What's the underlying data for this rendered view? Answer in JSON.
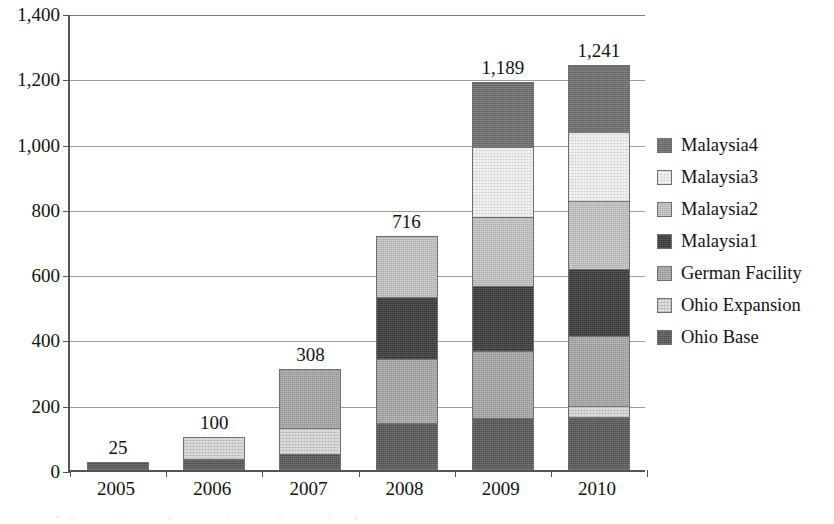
{
  "chart_data": {
    "type": "bar",
    "subtype": "stacked-bar",
    "title": "",
    "xlabel": "",
    "ylabel": "",
    "categories": [
      "2005",
      "2006",
      "2007",
      "2008",
      "2009",
      "2010"
    ],
    "ylim": [
      0,
      1400
    ],
    "ytick_values": [
      0,
      200,
      400,
      600,
      800,
      1000,
      1200,
      1400
    ],
    "ytick_labels": [
      "0",
      "200",
      "400",
      "600",
      "800",
      "1,000",
      "1,200",
      "1,400"
    ],
    "grid": true,
    "legend_position": "right",
    "stack_order_bottom_to_top": [
      "Ohio Base",
      "Ohio Expansion",
      "German Facility",
      "Malaysia1",
      "Malaysia2",
      "Malaysia3",
      "Malaysia4"
    ],
    "series": [
      {
        "name": "Ohio Base",
        "color": "#5b5b5b",
        "fill": "fill-ohio-base",
        "values": [
          25,
          35,
          48,
          145,
          160,
          163
        ]
      },
      {
        "name": "Ohio Expansion",
        "color": "#dedede",
        "fill": "fill-ohio-expansion",
        "values": [
          0,
          65,
          82,
          0,
          0,
          32
        ]
      },
      {
        "name": "German Facility",
        "color": "#a5a5a5",
        "fill": "fill-german-facility",
        "values": [
          0,
          0,
          178,
          195,
          205,
          215
        ]
      },
      {
        "name": "Malaysia1",
        "color": "#343434",
        "fill": "fill-malaysia1",
        "values": [
          0,
          0,
          0,
          190,
          200,
          205
        ]
      },
      {
        "name": "Malaysia2",
        "color": "#bcbcbc",
        "fill": "fill-malaysia2",
        "values": [
          0,
          0,
          0,
          186,
          210,
          210
        ]
      },
      {
        "name": "Malaysia3",
        "color": "#f2f2f0",
        "fill": "fill-malaysia3",
        "values": [
          0,
          0,
          0,
          0,
          215,
          210
        ]
      },
      {
        "name": "Malaysia4",
        "color": "#6e6e6e",
        "fill": "fill-malaysia4",
        "values": [
          0,
          0,
          0,
          0,
          199,
          206
        ]
      }
    ],
    "totals": [
      25,
      100,
      308,
      716,
      1189,
      1241
    ],
    "total_labels": [
      "25",
      "100",
      "308",
      "716",
      "1,189",
      "1,241"
    ]
  },
  "legend": {
    "items": [
      {
        "label": "Malaysia4",
        "fill": "fill-malaysia4"
      },
      {
        "label": "Malaysia3",
        "fill": "fill-malaysia3"
      },
      {
        "label": "Malaysia2",
        "fill": "fill-malaysia2"
      },
      {
        "label": "Malaysia1",
        "fill": "fill-malaysia1"
      },
      {
        "label": "German Facility",
        "fill": "fill-german-facility"
      },
      {
        "label": "Ohio Expansion",
        "fill": "fill-ohio-expansion"
      },
      {
        "label": "Ohio Base",
        "fill": "fill-ohio-base"
      }
    ]
  }
}
